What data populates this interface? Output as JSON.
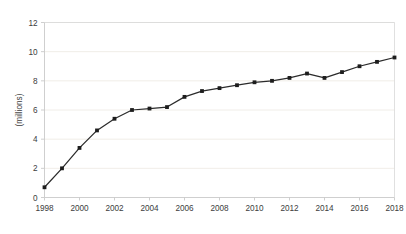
{
  "chart_data": {
    "type": "line",
    "title": "",
    "subtitle": "",
    "xlabel": "",
    "ylabel": "(millions)",
    "xlim": [
      1998,
      2018
    ],
    "ylim": [
      0,
      12
    ],
    "grid": "horizontal",
    "legend": "none",
    "x_tick_labels": [
      "1998",
      "2000",
      "2002",
      "2004",
      "2006",
      "2008",
      "2010",
      "2012",
      "2014",
      "2016",
      "2018"
    ],
    "y_tick_labels": [
      "0",
      "2",
      "4",
      "6",
      "8",
      "10",
      "12"
    ],
    "x_ticks": [
      1998,
      2000,
      2002,
      2004,
      2006,
      2008,
      2010,
      2012,
      2014,
      2016,
      2018
    ],
    "y_ticks": [
      0,
      2,
      4,
      6,
      8,
      10,
      12
    ],
    "x": [
      1998,
      1999,
      2000,
      2001,
      2002,
      2003,
      2004,
      2005,
      2006,
      2007,
      2008,
      2009,
      2010,
      2011,
      2012,
      2013,
      2014,
      2015,
      2016,
      2017,
      2018
    ],
    "values": [
      0.7,
      2.0,
      3.4,
      4.6,
      5.4,
      6.0,
      6.1,
      6.2,
      6.9,
      7.3,
      7.5,
      7.7,
      7.9,
      8.0,
      8.2,
      8.5,
      8.2,
      8.6,
      9.0,
      9.3,
      9.6
    ],
    "series": [
      {
        "name": "series-1",
        "color": "#2b2b2b",
        "marker": "square",
        "values": [
          0.7,
          2.0,
          3.4,
          4.6,
          5.4,
          6.0,
          6.1,
          6.2,
          6.9,
          7.3,
          7.5,
          7.7,
          7.9,
          8.0,
          8.2,
          8.5,
          8.2,
          8.6,
          9.0,
          9.3,
          9.6
        ]
      }
    ],
    "colors": {
      "line": "#2b2b2b",
      "marker": "#1d1d1d",
      "grid": "#ece9e2",
      "axis": "#c9c9c9",
      "text": "#3c3c3c",
      "background": "#ffffff"
    }
  }
}
